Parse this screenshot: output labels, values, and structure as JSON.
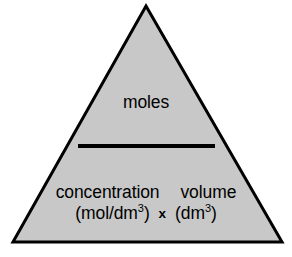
{
  "diagram": {
    "type": "formula-triangle",
    "canvas": {
      "width": 292,
      "height": 257,
      "background_color": "#ffffff"
    },
    "triangle": {
      "fill_color": "#c8c8c8",
      "stroke_color": "#000000",
      "stroke_width": 3,
      "apex": {
        "x": 146,
        "y": 6
      },
      "bottom_left": {
        "x": 13,
        "y": 242
      },
      "bottom_right": {
        "x": 282,
        "y": 242
      }
    },
    "division_bar": {
      "color": "#000000",
      "x1": 78,
      "x2": 215,
      "y": 146,
      "thickness": 4
    },
    "numerator": {
      "label": "moles"
    },
    "denominator": {
      "left_term": {
        "name": "concentration",
        "unit_open": "(mol/dm",
        "unit_superscript": "3",
        "unit_close": ")"
      },
      "operator": "x",
      "right_term": {
        "name": "volume",
        "unit_open": "(dm",
        "unit_superscript": "3",
        "unit_close": ")"
      }
    }
  }
}
